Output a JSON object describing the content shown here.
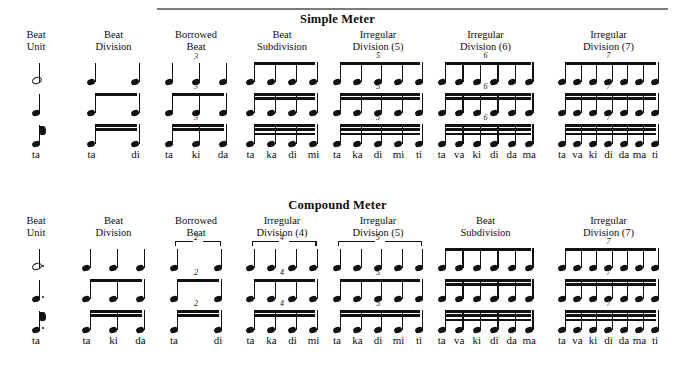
{
  "document": {
    "kind": "rhythm-syllables-reference-chart"
  },
  "sections": [
    {
      "id": "simple",
      "title": "Simple Meter",
      "has_top_rule": true,
      "columns": [
        {
          "header_line1": "Beat",
          "header_line2": "Unit",
          "syllables": [
            "ta"
          ],
          "rows": [
            {
              "notes": 1,
              "beams": 0,
              "tuplet": "",
              "bracket": false,
              "head": "hollow",
              "dotted": false,
              "flag": false
            },
            {
              "notes": 1,
              "beams": 0,
              "tuplet": "",
              "bracket": false,
              "head": "filled",
              "dotted": false,
              "flag": false
            },
            {
              "notes": 1,
              "beams": 0,
              "tuplet": "",
              "bracket": false,
              "head": "filled",
              "dotted": false,
              "flag": true
            }
          ]
        },
        {
          "header_line1": "Beat",
          "header_line2": "Division",
          "syllables": [
            "ta",
            "di"
          ],
          "rows": [
            {
              "notes": 2,
              "beams": 0,
              "tuplet": "",
              "bracket": false,
              "head": "filled",
              "dotted": false,
              "flag": false
            },
            {
              "notes": 2,
              "beams": 1,
              "tuplet": "",
              "bracket": false,
              "head": "filled",
              "dotted": false,
              "flag": false
            },
            {
              "notes": 2,
              "beams": 2,
              "tuplet": "",
              "bracket": false,
              "head": "filled",
              "dotted": false,
              "flag": false
            }
          ]
        },
        {
          "header_line1": "Borrowed",
          "header_line2": "Beat",
          "syllables": [
            "ta",
            "ki",
            "da"
          ],
          "rows": [
            {
              "notes": 3,
              "beams": 0,
              "tuplet": "3",
              "bracket": false,
              "head": "filled",
              "dotted": false,
              "flag": false
            },
            {
              "notes": 3,
              "beams": 1,
              "tuplet": "3",
              "bracket": false,
              "head": "filled",
              "dotted": false,
              "flag": false
            },
            {
              "notes": 3,
              "beams": 2,
              "tuplet": "3",
              "bracket": false,
              "head": "filled",
              "dotted": false,
              "flag": false
            }
          ]
        },
        {
          "header_line1": "Beat",
          "header_line2": "Subdivision",
          "syllables": [
            "ta",
            "ka",
            "di",
            "mi"
          ],
          "rows": [
            {
              "notes": 4,
              "beams": 1,
              "tuplet": "",
              "bracket": false,
              "head": "filled",
              "dotted": false,
              "flag": false
            },
            {
              "notes": 4,
              "beams": 2,
              "tuplet": "",
              "bracket": false,
              "head": "filled",
              "dotted": false,
              "flag": false
            },
            {
              "notes": 4,
              "beams": 3,
              "tuplet": "",
              "bracket": false,
              "head": "filled",
              "dotted": false,
              "flag": false
            }
          ]
        },
        {
          "header_line1": "Irregular",
          "header_line2": "Division (5)",
          "syllables": [
            "ta",
            "ka",
            "di",
            "mi",
            "ti"
          ],
          "rows": [
            {
              "notes": 5,
              "beams": 1,
              "tuplet": "5",
              "bracket": false,
              "head": "filled",
              "dotted": false,
              "flag": false
            },
            {
              "notes": 5,
              "beams": 2,
              "tuplet": "5",
              "bracket": false,
              "head": "filled",
              "dotted": false,
              "flag": false
            },
            {
              "notes": 5,
              "beams": 3,
              "tuplet": "5",
              "bracket": false,
              "head": "filled",
              "dotted": false,
              "flag": false
            }
          ]
        },
        {
          "header_line1": "Irregular",
          "header_line2": "Division (6)",
          "syllables": [
            "ta",
            "va",
            "ki",
            "di",
            "da",
            "ma"
          ],
          "rows": [
            {
              "notes": 6,
              "beams": 1,
              "tuplet": "6",
              "bracket": false,
              "head": "filled",
              "dotted": false,
              "flag": false
            },
            {
              "notes": 6,
              "beams": 2,
              "tuplet": "6",
              "bracket": false,
              "head": "filled",
              "dotted": false,
              "flag": false
            },
            {
              "notes": 6,
              "beams": 3,
              "tuplet": "6",
              "bracket": false,
              "head": "filled",
              "dotted": false,
              "flag": false
            }
          ]
        },
        {
          "header_line1": "Irregular",
          "header_line2": "Division (7)",
          "syllables": [
            "ta",
            "va",
            "ki",
            "di",
            "da",
            "ma",
            "ti"
          ],
          "rows": [
            {
              "notes": 7,
              "beams": 1,
              "tuplet": "7",
              "bracket": false,
              "head": "filled",
              "dotted": false,
              "flag": false
            },
            {
              "notes": 7,
              "beams": 2,
              "tuplet": "7",
              "bracket": false,
              "head": "filled",
              "dotted": false,
              "flag": false
            },
            {
              "notes": 7,
              "beams": 3,
              "tuplet": "7",
              "bracket": false,
              "head": "filled",
              "dotted": false,
              "flag": false
            }
          ]
        }
      ]
    },
    {
      "id": "compound",
      "title": "Compound Meter",
      "has_top_rule": false,
      "columns": [
        {
          "header_line1": "Beat",
          "header_line2": "Unit",
          "syllables": [
            "ta"
          ],
          "rows": [
            {
              "notes": 1,
              "beams": 0,
              "tuplet": "",
              "bracket": false,
              "head": "hollow",
              "dotted": true,
              "flag": false
            },
            {
              "notes": 1,
              "beams": 0,
              "tuplet": "",
              "bracket": false,
              "head": "filled",
              "dotted": true,
              "flag": false
            },
            {
              "notes": 1,
              "beams": 0,
              "tuplet": "",
              "bracket": false,
              "head": "filled",
              "dotted": true,
              "flag": true
            }
          ]
        },
        {
          "header_line1": "Beat",
          "header_line2": "Division",
          "syllables": [
            "ta",
            "ki",
            "da"
          ],
          "rows": [
            {
              "notes": 3,
              "beams": 0,
              "tuplet": "",
              "bracket": false,
              "head": "filled",
              "dotted": false,
              "flag": false
            },
            {
              "notes": 3,
              "beams": 1,
              "tuplet": "",
              "bracket": false,
              "head": "filled",
              "dotted": false,
              "flag": false
            },
            {
              "notes": 3,
              "beams": 2,
              "tuplet": "",
              "bracket": false,
              "head": "filled",
              "dotted": false,
              "flag": false
            }
          ]
        },
        {
          "header_line1": "Borrowed",
          "header_line2": "Beat",
          "syllables": [
            "ta",
            "di"
          ],
          "rows": [
            {
              "notes": 2,
              "beams": 0,
              "tuplet": "2",
              "bracket": true,
              "head": "filled",
              "dotted": false,
              "flag": false
            },
            {
              "notes": 2,
              "beams": 1,
              "tuplet": "2",
              "bracket": false,
              "head": "filled",
              "dotted": false,
              "flag": false
            },
            {
              "notes": 2,
              "beams": 2,
              "tuplet": "2",
              "bracket": false,
              "head": "filled",
              "dotted": false,
              "flag": false
            }
          ]
        },
        {
          "header_line1": "Irregular",
          "header_line2": "Division (4)",
          "syllables": [
            "ta",
            "ka",
            "di",
            "mi"
          ],
          "rows": [
            {
              "notes": 4,
              "beams": 0,
              "tuplet": "4",
              "bracket": true,
              "head": "filled",
              "dotted": false,
              "flag": false
            },
            {
              "notes": 4,
              "beams": 1,
              "tuplet": "4",
              "bracket": false,
              "head": "filled",
              "dotted": false,
              "flag": false
            },
            {
              "notes": 4,
              "beams": 2,
              "tuplet": "4",
              "bracket": false,
              "head": "filled",
              "dotted": false,
              "flag": false
            }
          ]
        },
        {
          "header_line1": "Irregular",
          "header_line2": "Division (5)",
          "syllables": [
            "ta",
            "ka",
            "di",
            "mi",
            "ti"
          ],
          "rows": [
            {
              "notes": 5,
              "beams": 0,
              "tuplet": "5",
              "bracket": true,
              "head": "filled",
              "dotted": false,
              "flag": false
            },
            {
              "notes": 5,
              "beams": 1,
              "tuplet": "5",
              "bracket": false,
              "head": "filled",
              "dotted": false,
              "flag": false
            },
            {
              "notes": 5,
              "beams": 2,
              "tuplet": "5",
              "bracket": false,
              "head": "filled",
              "dotted": false,
              "flag": false
            }
          ]
        },
        {
          "header_line1": "Beat",
          "header_line2": "Subdivision",
          "syllables": [
            "ta",
            "va",
            "ki",
            "di",
            "da",
            "ma"
          ],
          "rows": [
            {
              "notes": 6,
              "beams": 1,
              "tuplet": "",
              "bracket": false,
              "head": "filled",
              "dotted": false,
              "flag": false
            },
            {
              "notes": 6,
              "beams": 2,
              "tuplet": "",
              "bracket": false,
              "head": "filled",
              "dotted": false,
              "flag": false
            },
            {
              "notes": 6,
              "beams": 3,
              "tuplet": "",
              "bracket": false,
              "head": "filled",
              "dotted": false,
              "flag": false
            }
          ]
        },
        {
          "header_line1": "Irregular",
          "header_line2": "Division (7)",
          "syllables": [
            "ta",
            "va",
            "ki",
            "di",
            "da",
            "ma",
            "ti"
          ],
          "rows": [
            {
              "notes": 7,
              "beams": 1,
              "tuplet": "7",
              "bracket": false,
              "head": "filled",
              "dotted": false,
              "flag": false
            },
            {
              "notes": 7,
              "beams": 2,
              "tuplet": "7",
              "bracket": false,
              "head": "filled",
              "dotted": false,
              "flag": false
            },
            {
              "notes": 7,
              "beams": 3,
              "tuplet": "7",
              "bracket": false,
              "head": "filled",
              "dotted": false,
              "flag": false
            }
          ]
        }
      ]
    }
  ],
  "layout": {
    "column_widths_simple": [
      72,
      83,
      82,
      90,
      102,
      113,
      133
    ],
    "column_widths_compound": [
      72,
      83,
      82,
      90,
      102,
      113,
      133
    ],
    "note_spacing": [
      0,
      44,
      26,
      20,
      20,
      17,
      15
    ]
  }
}
